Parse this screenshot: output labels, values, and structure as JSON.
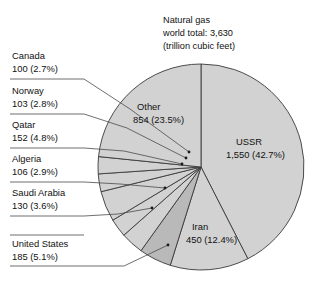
{
  "chart_data": {
    "type": "pie",
    "title": "Natural gas world total: 3,630 (trillion cubic feet)",
    "title_lines": [
      "Natural gas",
      "world total: 3,630",
      "(trillion cubic feet)"
    ],
    "units": "trillion cubic feet",
    "total": 3630,
    "xlabel": "",
    "ylabel": "",
    "grid": false,
    "legend_position": "callout-labels",
    "start_angle_deg": 0,
    "direction": "clockwise",
    "categories": [
      "USSR",
      "Iran",
      "United States",
      "Saudi Arabia",
      "Algeria",
      "Qatar",
      "Norway",
      "Canada",
      "Other"
    ],
    "values": [
      1550,
      450,
      185,
      130,
      106,
      152,
      103,
      100,
      854
    ],
    "percentages": [
      42.7,
      12.4,
      5.1,
      3.6,
      2.9,
      4.8,
      2.8,
      2.7,
      23.5
    ],
    "slices": [
      {
        "name": "USSR",
        "value": 1550,
        "value_label": "1,550",
        "percent": 42.7,
        "percent_label": "(42.7%)",
        "color": "#d2d2d2",
        "label_placement": "inside"
      },
      {
        "name": "Iran",
        "value": 450,
        "value_label": "450",
        "percent": 12.4,
        "percent_label": "(12.4%)",
        "color": "#d2d2d2",
        "label_placement": "inside"
      },
      {
        "name": "United States",
        "value": 185,
        "value_label": "185",
        "percent": 5.1,
        "percent_label": "(5.1%)",
        "color": "#b9b9b9",
        "label_placement": "callout"
      },
      {
        "name": "Saudi Arabia",
        "value": 130,
        "value_label": "130",
        "percent": 3.6,
        "percent_label": "(3.6%)",
        "color": "#d2d2d2",
        "label_placement": "callout"
      },
      {
        "name": "Algeria",
        "value": 106,
        "value_label": "106",
        "percent": 2.9,
        "percent_label": "(2.9%)",
        "color": "#d2d2d2",
        "label_placement": "callout"
      },
      {
        "name": "Qatar",
        "value": 152,
        "value_label": "152",
        "percent": 4.8,
        "percent_label": "(4.8%)",
        "color": "#d2d2d2",
        "label_placement": "callout"
      },
      {
        "name": "Norway",
        "value": 103,
        "value_label": "103",
        "percent": 2.8,
        "percent_label": "(2.8%)",
        "color": "#d2d2d2",
        "label_placement": "callout"
      },
      {
        "name": "Canada",
        "value": 100,
        "value_label": "100",
        "percent": 2.7,
        "percent_label": "(2.7%)",
        "color": "#d2d2d2",
        "label_placement": "callout"
      },
      {
        "name": "Other",
        "value": 854,
        "value_label": "854",
        "percent": 23.5,
        "percent_label": "(23.5%)",
        "color": "#d2d2d2",
        "label_placement": "inside"
      }
    ]
  },
  "inner_labels": {
    "ussr": {
      "name": "USSR",
      "amount": "1,550 (42.7%)"
    },
    "other": {
      "name": "Other",
      "amount": "854 (23.5%)"
    },
    "iran": {
      "name": "Iran",
      "amount": "450 (12.4%)"
    }
  },
  "callouts": [
    {
      "name": "Canada",
      "amount": "100 (2.7%)"
    },
    {
      "name": "Norway",
      "amount": "103 (2.8%)"
    },
    {
      "name": "Qatar",
      "amount": "152 (4.8%)"
    },
    {
      "name": "Algeria",
      "amount": "106 (2.9%)"
    },
    {
      "name": "Saudi Arabia",
      "amount": "130 (3.6%)"
    },
    {
      "name": "United States",
      "amount": "185 (5.1%)"
    }
  ],
  "colors": {
    "slice_light": "#d2d2d2",
    "slice_dark": "#b9b9b9",
    "outline": "#3a3a3a",
    "text": "#111111",
    "background": "#ffffff"
  }
}
